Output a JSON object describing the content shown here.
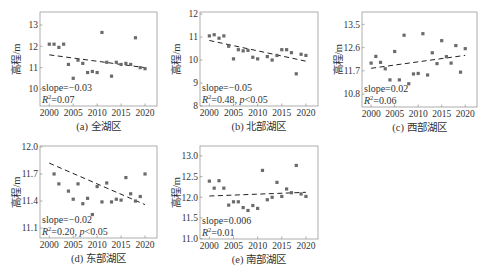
{
  "figure": {
    "width": 486,
    "height": 280,
    "point_color": "#6b6b6b",
    "axis_color": "#999999",
    "trend_color": "#222222"
  },
  "chart_data": [
    {
      "id": "a",
      "type": "scatter",
      "caption": "(a) 全湖区",
      "ylabel": "高程/m",
      "xlabel": "",
      "box": [
        40,
        12,
        157,
        106
      ],
      "xlim": [
        1998.06,
        2022.5
      ],
      "ylim": [
        9.2,
        13.61
      ],
      "xticks": [
        2000,
        2005,
        2010,
        2015,
        2020
      ],
      "yticks": [
        10,
        11,
        12,
        13
      ],
      "ytick_labels": [
        "10",
        "11",
        "12",
        "13"
      ],
      "x": [
        2000,
        2001,
        2002,
        2003,
        2004,
        2005,
        2006,
        2007,
        2008,
        2009,
        2010,
        2011,
        2012,
        2013,
        2014,
        2015,
        2016,
        2017,
        2018,
        2019,
        2020
      ],
      "y": [
        12.1,
        12.1,
        11.95,
        12.1,
        11.15,
        10.5,
        11.35,
        11.2,
        10.77,
        10.82,
        10.77,
        12.65,
        11.25,
        10.6,
        11.25,
        11.15,
        11.2,
        11.15,
        12.4,
        11.0,
        10.95
      ],
      "trend": {
        "x": [
          2000,
          2020
        ],
        "y": [
          11.6,
          11.0
        ]
      },
      "annotation": {
        "slope": "slope=−0.03",
        "r2": "0.07",
        "p": ""
      },
      "grid": false
    },
    {
      "id": "b",
      "type": "scatter",
      "caption": "(b) 北部湖区",
      "ylabel": "高程/m",
      "xlabel": "",
      "box": [
        200,
        12,
        318,
        106
      ],
      "xlim": [
        1998.06,
        2022.5
      ],
      "ylim": [
        8.0,
        12.09
      ],
      "xticks": [
        2000,
        2005,
        2010,
        2015,
        2020
      ],
      "yticks": [
        8,
        9,
        10,
        11,
        12
      ],
      "ytick_labels": [
        "8",
        "9",
        "10",
        "11",
        "12"
      ],
      "x": [
        2000,
        2001,
        2002,
        2003,
        2004,
        2005,
        2006,
        2007,
        2008,
        2009,
        2010,
        2012,
        2013,
        2014,
        2015,
        2016,
        2017,
        2018,
        2019,
        2020
      ],
      "y": [
        11.05,
        11.1,
        10.95,
        11.05,
        10.6,
        10.05,
        10.45,
        10.4,
        10.42,
        10.12,
        10.05,
        10.15,
        10.0,
        10.2,
        10.45,
        10.45,
        10.32,
        9.4,
        10.25,
        10.2
      ],
      "trend": {
        "x": [
          2000,
          2020
        ],
        "y": [
          10.85,
          9.95
        ]
      },
      "annotation": {
        "slope": "slope=−0.05",
        "r2": "0.48",
        "p": "<0.05"
      },
      "grid": false
    },
    {
      "id": "c",
      "type": "scatter",
      "caption": "(c) 西部湖区",
      "ylabel": "高程/m",
      "xlabel": "",
      "box": [
        362,
        12,
        477,
        107
      ],
      "xlim": [
        1998.06,
        2022.5
      ],
      "ylim": [
        10.3,
        13.98
      ],
      "xticks": [
        2000,
        2005,
        2010,
        2015,
        2020
      ],
      "yticks": [
        10.8,
        11.7,
        12.6,
        13.5
      ],
      "ytick_labels": [
        "10.8",
        "11.7",
        "12.6",
        "13.5"
      ],
      "x": [
        2000,
        2001,
        2002,
        2003,
        2004,
        2005,
        2006,
        2007,
        2008,
        2009,
        2010,
        2011,
        2012,
        2013,
        2014,
        2015,
        2016,
        2017,
        2018,
        2019,
        2020
      ],
      "y": [
        12.0,
        12.26,
        12.03,
        11.78,
        11.35,
        12.45,
        11.35,
        13.08,
        11.2,
        11.58,
        11.6,
        13.14,
        11.54,
        12.4,
        11.98,
        12.87,
        12.25,
        12.0,
        12.68,
        11.65,
        12.56
      ],
      "trend": {
        "x": [
          2000,
          2020
        ],
        "y": [
          11.8,
          12.3
        ]
      },
      "annotation": {
        "slope": "slope=0.02",
        "r2": "0.06",
        "p": ""
      },
      "grid": false
    },
    {
      "id": "d",
      "type": "scatter",
      "caption": "(d) 东部湖区",
      "ylabel": "高程/m",
      "xlabel": "",
      "box": [
        40,
        146,
        157,
        238
      ],
      "xlim": [
        1998.06,
        2022.5
      ],
      "ylim": [
        10.99,
        12.01
      ],
      "xticks": [
        2000,
        2005,
        2010,
        2015,
        2020
      ],
      "yticks": [
        11.1,
        11.4,
        11.7,
        12.0
      ],
      "ytick_labels": [
        "11.1",
        "11.4",
        "11.7",
        "12.0"
      ],
      "x": [
        2001,
        2002,
        2004,
        2005,
        2006,
        2007,
        2008,
        2009,
        2010,
        2011,
        2012,
        2013,
        2014,
        2015,
        2016,
        2017,
        2018,
        2019,
        2020
      ],
      "y": [
        11.7,
        11.59,
        11.51,
        11.42,
        11.59,
        11.37,
        11.43,
        11.25,
        11.56,
        11.39,
        11.6,
        11.39,
        11.42,
        11.41,
        11.66,
        11.48,
        11.4,
        11.45,
        11.7
      ],
      "trend": {
        "x": [
          2000,
          2020
        ],
        "y": [
          11.82,
          11.36
        ]
      },
      "annotation": {
        "slope": "slope=−0.02",
        "r2": "0.20",
        "p": "<0.05"
      },
      "grid": false
    },
    {
      "id": "e",
      "type": "scatter",
      "caption": "(e) 南部湖区",
      "ylabel": "高程/m",
      "xlabel": "",
      "box": [
        200,
        146,
        318,
        239
      ],
      "xlim": [
        1998.06,
        2022.5
      ],
      "ylim": [
        10.99,
        13.24
      ],
      "xticks": [
        2000,
        2005,
        2010,
        2015,
        2020
      ],
      "yticks": [
        11.0,
        11.5,
        12.0,
        12.5,
        13.0
      ],
      "ytick_labels": [
        "11.0",
        "11.5",
        "12.0",
        "12.5",
        "13.0"
      ],
      "x": [
        2000,
        2001,
        2002,
        2003,
        2004,
        2005,
        2006,
        2007,
        2008,
        2009,
        2010,
        2011,
        2012,
        2013,
        2014,
        2015,
        2016,
        2017,
        2018,
        2019,
        2020
      ],
      "y": [
        12.39,
        12.22,
        12.4,
        12.22,
        11.81,
        11.89,
        11.89,
        11.75,
        11.68,
        11.8,
        11.73,
        12.65,
        11.94,
        12.0,
        12.36,
        12.02,
        12.2,
        12.11,
        12.77,
        12.08,
        12.02
      ],
      "trend": {
        "x": [
          2000,
          2020
        ],
        "y": [
          12.03,
          12.12
        ]
      },
      "annotation": {
        "slope": "slope=0.006",
        "r2": "0.01",
        "p": ""
      },
      "grid": false
    }
  ]
}
